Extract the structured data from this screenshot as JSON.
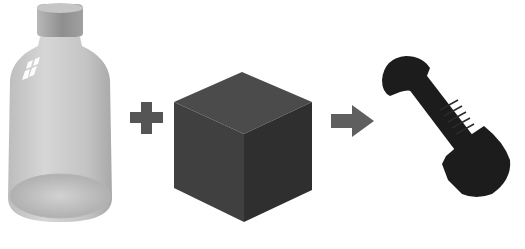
{
  "scene": {
    "description": "Reaction illustration: bottle plus cube yields bolt",
    "items": [
      {
        "name": "bottle",
        "label": "glass bottle"
      },
      {
        "name": "plus",
        "label": "+"
      },
      {
        "name": "cube",
        "label": "dark cube"
      },
      {
        "name": "arrow",
        "label": "right arrow"
      },
      {
        "name": "bolt",
        "label": "black bolt"
      }
    ]
  },
  "colors": {
    "background": "#ffffff",
    "bottle_body": "#c8c8c8",
    "bottle_cap": "#9a9a9a",
    "operator": "#555555",
    "cube_top": "#4a4a4a",
    "cube_left": "#3e3e3e",
    "cube_right": "#2e2e2e",
    "bolt": "#1a1a1a"
  }
}
